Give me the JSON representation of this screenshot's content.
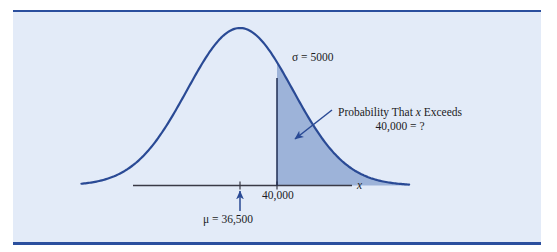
{
  "figure": {
    "kind": "normal-distribution-diagram",
    "panel_background": "#e3ebf8",
    "rule_color": "#2b4f9e",
    "curve_color": "#2a4a95",
    "shade_color": "#9db3d9",
    "axis_color": "#3a3a46",
    "text_color": "#1b1b24"
  },
  "labels": {
    "sigma": "σ  = 5000",
    "probability_line1_pre": "Probability That ",
    "probability_line1_var": "x",
    "probability_line1_post": " Exceeds",
    "probability_line2": "40,000 = ?",
    "tick_value": "40,000",
    "axis_variable": "x",
    "mu": "μ  = 36,500"
  },
  "chart_data": {
    "type": "line",
    "title": "",
    "subtitle": "",
    "xlabel": "x",
    "ylabel": "",
    "grid": false,
    "legend_position": "none",
    "distribution": "normal",
    "mean": 36500,
    "sigma": 5000,
    "mean_label": "μ  = 36,500",
    "sigma_label": "σ  = 5000",
    "shaded_region": {
      "from": 40000,
      "to": "infinity",
      "tail": "right",
      "label_line1": "Probability That x Exceeds",
      "label_line2": "40,000 = ?",
      "value": "?"
    },
    "axis_ticks": [
      {
        "value": 36500,
        "label": "",
        "marker": "arrow",
        "is_mean": true
      },
      {
        "value": 40000,
        "label": "40,000",
        "marker": "tick",
        "is_mean": false
      }
    ],
    "x_domain": [
      21500,
      52500
    ],
    "ylim": [
      0,
      1
    ],
    "annotations": [
      {
        "text": "σ  = 5000",
        "x": 46000,
        "y": 0.78
      },
      {
        "text": "Probability That x Exceeds 40,000 = ?",
        "x": 48000,
        "y": 0.45,
        "arrow_to_x": 40800,
        "arrow_to_y": 0.28
      }
    ],
    "curve_points_x": [
      21500,
      24000,
      26500,
      29000,
      31500,
      34000,
      36500,
      39000,
      41500,
      44000,
      46500,
      49000,
      51500
    ],
    "curve_points_y": [
      0.011,
      0.044,
      0.135,
      0.325,
      0.607,
      0.882,
      1.0,
      0.882,
      0.607,
      0.325,
      0.135,
      0.044,
      0.011
    ]
  }
}
